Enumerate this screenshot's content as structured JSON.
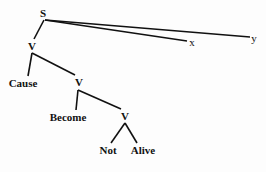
{
  "diagram": {
    "type": "syntax-tree",
    "nodes": {
      "s": {
        "label": "S",
        "x": 43,
        "y": 13
      },
      "x": {
        "label": "x",
        "x": 192,
        "y": 42
      },
      "y": {
        "label": "y",
        "x": 254,
        "y": 38
      },
      "v1": {
        "label": "V",
        "x": 32,
        "y": 46
      },
      "cause": {
        "label": "Cause",
        "x": 23,
        "y": 83
      },
      "v2": {
        "label": "V",
        "x": 79,
        "y": 82
      },
      "become": {
        "label": "Become",
        "x": 68,
        "y": 117
      },
      "v3": {
        "label": "V",
        "x": 125,
        "y": 116
      },
      "not": {
        "label": "Not",
        "x": 108,
        "y": 150
      },
      "alive": {
        "label": "Alive",
        "x": 143,
        "y": 150
      }
    },
    "edges": [
      [
        "s",
        "v1"
      ],
      [
        "s",
        "x"
      ],
      [
        "s",
        "y"
      ],
      [
        "v1",
        "cause"
      ],
      [
        "v1",
        "v2"
      ],
      [
        "v2",
        "become"
      ],
      [
        "v2",
        "v3"
      ],
      [
        "v3",
        "not"
      ],
      [
        "v3",
        "alive"
      ]
    ],
    "line_color": "#111111"
  }
}
